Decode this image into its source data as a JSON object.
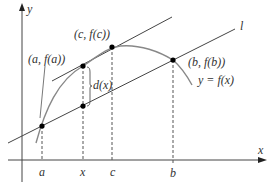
{
  "diagram": {
    "axes": {
      "x_label": "x",
      "y_label": "y"
    },
    "points": [
      {
        "id": "a_point",
        "label": "(a, f(a))"
      },
      {
        "id": "c_point",
        "label": "(c, f(c))"
      },
      {
        "id": "b_point",
        "label": "(b, f(b))"
      }
    ],
    "curve_label": "y = f(x)",
    "secant_label": "l",
    "distance_label": "d(x)",
    "ticks": [
      "a",
      "x",
      "c",
      "b"
    ],
    "colors": {
      "curve": "#888888",
      "lines": "#333333",
      "points": "#000000"
    }
  }
}
